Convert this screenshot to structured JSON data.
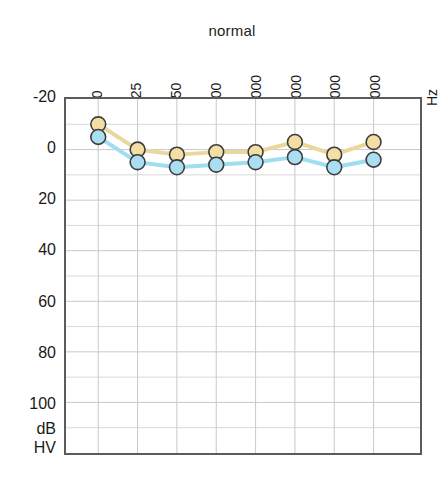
{
  "chart_data": {
    "type": "line",
    "title": "normal",
    "xlabel": "Hz",
    "ylabel": "dB HV",
    "ylabel_lines": [
      "dB",
      "HV"
    ],
    "categories": [
      "60",
      "125",
      "250",
      "500",
      "1000",
      "2000",
      "4000",
      "8000"
    ],
    "x_tick_labels": [
      "60",
      "125",
      "250",
      "500",
      "1000",
      "2000",
      "4000",
      "8000",
      "Hz"
    ],
    "y_tick_labels": [
      "-20",
      "0",
      "20",
      "40",
      "60",
      "80",
      "100"
    ],
    "y_tick_values": [
      -20,
      0,
      20,
      40,
      60,
      80,
      100
    ],
    "ylim": [
      -20,
      120
    ],
    "y_axis_inverted": true,
    "grid": true,
    "legend": "none",
    "series": [
      {
        "name": "air-conduction-right",
        "color": "#EBD79B",
        "marker_fill": "#F3DFA4",
        "marker_edge": "#3c3c3c",
        "values": [
          -10,
          0,
          2,
          1,
          1,
          -3,
          2,
          -3
        ]
      },
      {
        "name": "air-conduction-left",
        "color": "#9FDDF0",
        "marker_fill": "#A9DFF1",
        "marker_edge": "#3c3c3c",
        "values": [
          -5,
          5,
          7,
          6,
          5,
          3,
          7,
          4
        ]
      }
    ]
  },
  "colors": {
    "series_yellow": "#EBD79B",
    "series_blue": "#9FDDF0",
    "marker_edge": "#3c3c3c",
    "axis": "#5b5b5b",
    "grid": "#c8c8c8",
    "text": "#1a1a1a",
    "background": "#ffffff"
  }
}
